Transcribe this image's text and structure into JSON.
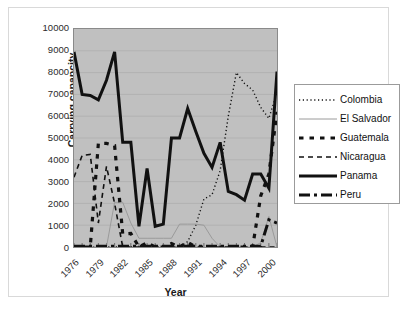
{
  "axes": {
    "ylabel": "Carrying capapcity",
    "xlabel": "Year",
    "yticks": [
      "10000",
      "9000",
      "8000",
      "7000",
      "6000",
      "5000",
      "4000",
      "3000",
      "2000",
      "1000",
      "0"
    ],
    "xticks": [
      "1976",
      "1979",
      "1982",
      "1985",
      "1988",
      "1991",
      "1994",
      "1997",
      "2000"
    ]
  },
  "legend": {
    "items": [
      {
        "label": "Colombia",
        "key": "dotted-line-key"
      },
      {
        "label": "El Salvador",
        "key": "thin-gray-line-key"
      },
      {
        "label": "Guatemala",
        "key": "thick-square-dash-line-key"
      },
      {
        "label": "Nicaragua",
        "key": "dashed-line-key"
      },
      {
        "label": "Panama",
        "key": "thick-solid-line-key"
      },
      {
        "label": "Peru",
        "key": "thick-dash-dot-line-key"
      }
    ]
  },
  "caption": {
    "text": ""
  },
  "chart_data": {
    "type": "line",
    "title": "",
    "xlabel": "Year",
    "ylabel": "Carrying capapcity",
    "ylim": [
      0,
      10000
    ],
    "ytick_step": 1000,
    "grid": true,
    "legend_position": "right",
    "plot_background": "#c0c0c0",
    "x": [
      1976,
      1977,
      1978,
      1979,
      1980,
      1981,
      1982,
      1983,
      1984,
      1985,
      1986,
      1987,
      1988,
      1989,
      1990,
      1991,
      1992,
      1993,
      1994,
      1995,
      1996,
      1997,
      1998,
      1999,
      2000,
      2001
    ],
    "xtick_labels": [
      "1976",
      "1979",
      "1982",
      "1985",
      "1988",
      "1991",
      "1994",
      "1997",
      "2000"
    ],
    "series": [
      {
        "name": "Colombia",
        "style": "dotted",
        "color": "#111111",
        "width": 1.4,
        "values": [
          0,
          0,
          0,
          0,
          0,
          0,
          0,
          0,
          0,
          0,
          0,
          0,
          0,
          0,
          250,
          1000,
          2200,
          2400,
          3500,
          6000,
          8000,
          7500,
          7200,
          6400,
          5900,
          7100
        ]
      },
      {
        "name": "El Salvador",
        "style": "solid",
        "color": "#9a9a9a",
        "width": 1.0,
        "values": [
          0,
          0,
          0,
          0,
          0,
          2050,
          2050,
          1100,
          400,
          400,
          400,
          400,
          400,
          1050,
          1050,
          1050,
          1000,
          400,
          0,
          0,
          0,
          0,
          0,
          200,
          1400,
          0
        ]
      },
      {
        "name": "Guatemala",
        "style": "square-dash",
        "color": "#111111",
        "width": 3.2,
        "values": [
          0,
          0,
          0,
          4750,
          4750,
          4650,
          600,
          620,
          0,
          200,
          0,
          0,
          160,
          0,
          220,
          0,
          0,
          0,
          0,
          0,
          0,
          0,
          0,
          2350,
          3350,
          6200
        ]
      },
      {
        "name": "Nicaragua",
        "style": "dashed",
        "color": "#111111",
        "width": 1.6,
        "values": [
          3200,
          4200,
          4250,
          1100,
          3700,
          2000,
          0,
          0,
          0,
          0,
          0,
          0,
          0,
          0,
          0,
          0,
          0,
          0,
          0,
          0,
          0,
          0,
          0,
          0,
          0,
          0
        ]
      },
      {
        "name": "Panama",
        "style": "solid",
        "color": "#111111",
        "width": 3.0,
        "values": [
          8950,
          7000,
          6950,
          6750,
          7650,
          8950,
          4800,
          4800,
          950,
          3600,
          950,
          1050,
          5000,
          5000,
          6350,
          5300,
          4300,
          3650,
          4800,
          2550,
          2400,
          2150,
          3350,
          3350,
          2700,
          8050
        ]
      },
      {
        "name": "Peru",
        "style": "dash-dot",
        "color": "#111111",
        "width": 3.0,
        "values": [
          40,
          40,
          40,
          40,
          40,
          40,
          40,
          40,
          40,
          40,
          40,
          40,
          40,
          40,
          40,
          40,
          40,
          40,
          40,
          40,
          40,
          40,
          40,
          40,
          1250,
          1100
        ]
      }
    ]
  }
}
